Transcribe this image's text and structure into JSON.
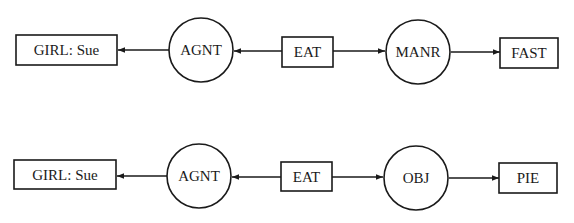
{
  "diagram": {
    "type": "conceptual-graph",
    "colors": {
      "stroke": "#1a1a1a",
      "background": "#ffffff"
    },
    "graphs": [
      {
        "id": "graph-1",
        "nodes": [
          {
            "id": "girl",
            "kind": "concept",
            "label": "GIRL: Sue"
          },
          {
            "id": "agnt",
            "kind": "relation",
            "label": "AGNT"
          },
          {
            "id": "eat",
            "kind": "concept",
            "label": "EAT"
          },
          {
            "id": "manr",
            "kind": "relation",
            "label": "MANR"
          },
          {
            "id": "fast",
            "kind": "concept",
            "label": "FAST"
          }
        ],
        "edges": [
          {
            "from": "eat",
            "to": "agnt"
          },
          {
            "from": "agnt",
            "to": "girl"
          },
          {
            "from": "eat",
            "to": "manr"
          },
          {
            "from": "manr",
            "to": "fast"
          }
        ]
      },
      {
        "id": "graph-2",
        "nodes": [
          {
            "id": "girl",
            "kind": "concept",
            "label": "GIRL: Sue"
          },
          {
            "id": "agnt",
            "kind": "relation",
            "label": "AGNT"
          },
          {
            "id": "eat",
            "kind": "concept",
            "label": "EAT"
          },
          {
            "id": "obj",
            "kind": "relation",
            "label": "OBJ"
          },
          {
            "id": "pie",
            "kind": "concept",
            "label": "PIE"
          }
        ],
        "edges": [
          {
            "from": "eat",
            "to": "agnt"
          },
          {
            "from": "agnt",
            "to": "girl"
          },
          {
            "from": "eat",
            "to": "obj"
          },
          {
            "from": "obj",
            "to": "pie"
          }
        ]
      }
    ]
  }
}
